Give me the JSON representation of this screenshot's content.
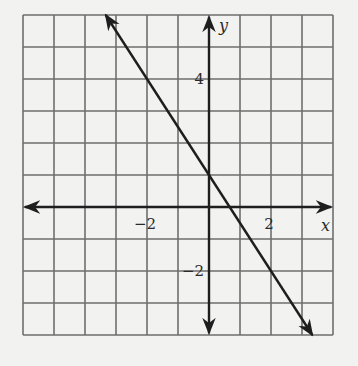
{
  "chart_data": {
    "type": "line",
    "title": "",
    "xlabel": "x",
    "ylabel": "y",
    "xlim": [
      -6,
      4
    ],
    "ylim": [
      -4,
      6
    ],
    "grid": true,
    "grid_step": 1,
    "x_tick_labels": [
      {
        "value": -2,
        "label": "−2"
      },
      {
        "value": 2,
        "label": "2"
      }
    ],
    "y_tick_labels": [
      {
        "value": 4,
        "label": "4"
      },
      {
        "value": -2,
        "label": "−2"
      }
    ],
    "series": [
      {
        "name": "line",
        "equation": "y = -1.5x + 1",
        "slope": -1.5,
        "intercept": 1,
        "x": [
          -3.333,
          0,
          0.667,
          2,
          3.333
        ],
        "y": [
          6,
          1,
          0,
          -2,
          -4
        ],
        "arrows_both_ends": true
      }
    ],
    "legend": null
  },
  "colors": {
    "background": "#f2f2f0",
    "grid": "#6e6e6e",
    "axes": "#1e1e1e",
    "line": "#1e1e1e"
  }
}
